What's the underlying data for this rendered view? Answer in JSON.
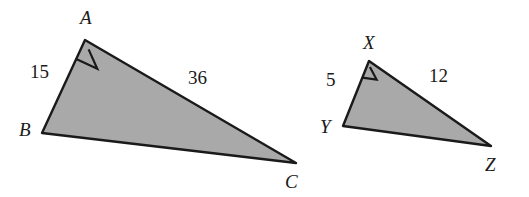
{
  "figure": {
    "background_color": "#ffffff",
    "fill_color": "#a9a9a9",
    "stroke_color": "#1a1a1a",
    "label_color": "#1a1a1a"
  },
  "shapes": [
    {
      "name": "triangle-abc",
      "type": "right-triangle",
      "right_angle_at": "A",
      "vertices": [
        {
          "id": "A",
          "label": "A",
          "x": 85,
          "y": 40,
          "label_x": 80,
          "label_y": 8
        },
        {
          "id": "B",
          "label": "B",
          "x": 42,
          "y": 133,
          "label_x": 19,
          "label_y": 120
        },
        {
          "id": "C",
          "label": "C",
          "x": 296,
          "y": 163,
          "label_x": 285,
          "label_y": 172
        }
      ],
      "sides": [
        {
          "name": "AB",
          "label": "15",
          "value": 15,
          "label_x": 30,
          "label_y": 62
        },
        {
          "name": "AC",
          "label": "36",
          "value": 36,
          "label_x": 188,
          "label_y": 68
        }
      ]
    },
    {
      "name": "triangle-xyz",
      "type": "right-triangle",
      "right_angle_at": "X",
      "vertices": [
        {
          "id": "X",
          "label": "X",
          "x": 369,
          "y": 61,
          "label_x": 363,
          "label_y": 33
        },
        {
          "id": "Y",
          "label": "Y",
          "x": 343,
          "y": 126,
          "label_x": 320,
          "label_y": 117
        },
        {
          "id": "Z",
          "label": "Z",
          "x": 491,
          "y": 146,
          "label_x": 485,
          "label_y": 155
        }
      ],
      "sides": [
        {
          "name": "XY",
          "label": "5",
          "value": 5,
          "label_x": 326,
          "label_y": 70
        },
        {
          "name": "XZ",
          "label": "12",
          "value": 12,
          "label_x": 429,
          "label_y": 66
        }
      ]
    }
  ]
}
